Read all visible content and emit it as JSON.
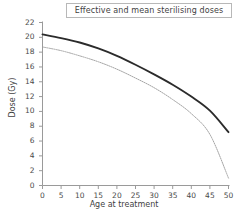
{
  "chart_data": {
    "type": "line",
    "title": "Effective and mean sterilising doses",
    "xlabel": "Age at treatment",
    "ylabel": "Dose (Gy)",
    "xlim": [
      0,
      50
    ],
    "ylim": [
      0,
      22
    ],
    "xticks": [
      0,
      5,
      10,
      15,
      20,
      25,
      30,
      35,
      40,
      45,
      50
    ],
    "xtick_labels": [
      "0",
      "5",
      "10",
      "15",
      "20",
      "25",
      "30",
      "35",
      "40",
      "45",
      "50"
    ],
    "yticks": [
      0,
      2,
      4,
      6,
      8,
      10,
      12,
      14,
      16,
      18,
      20,
      22
    ],
    "ytick_labels": [
      "0",
      "2",
      "4",
      "6",
      "8",
      "10",
      "12",
      "14",
      "16",
      "18",
      "20",
      "22"
    ],
    "grid": false,
    "legend": "none",
    "x": [
      0,
      5,
      10,
      15,
      20,
      25,
      30,
      35,
      40,
      45,
      50
    ],
    "series": [
      {
        "name": "Effective sterilising dose",
        "style": "solid-thick",
        "color": "#2b2b2b",
        "values": [
          20.4,
          19.9,
          19.3,
          18.5,
          17.5,
          16.3,
          15.0,
          13.6,
          12.0,
          10.1,
          7.2
        ]
      },
      {
        "name": "Mean sterilising dose",
        "style": "dotted-thin",
        "color": "#9a9a9a",
        "values": [
          18.7,
          18.2,
          17.5,
          16.7,
          15.7,
          14.5,
          13.2,
          11.6,
          9.7,
          6.9,
          1.0
        ]
      }
    ],
    "axis_color": "#9a9a9a",
    "text_color": "#3f3f3f",
    "background": "#ffffff"
  },
  "title_box": {
    "label": "Effective and mean sterilising doses"
  }
}
